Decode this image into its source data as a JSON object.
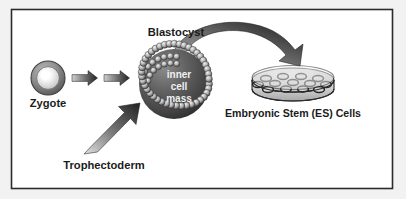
{
  "figure": {
    "background_color": "#f2f2f2",
    "panel_color": "#ffffff",
    "border_color": "#2b2b2b",
    "ink_color": "#1b1b1b"
  },
  "labels": {
    "zygote": "Zygote",
    "blastocyst": "Blastocyst",
    "trophectoderm": "Trophectoderm",
    "es_cells": "Embryonic Stem (ES) Cells"
  },
  "inner_cell_mass": {
    "line1": "inner",
    "line2": "cell",
    "line3": "mass"
  },
  "stages": [
    {
      "id": "zygote",
      "label": "Zygote",
      "shape": "sphere-with-zona-pellucida",
      "center": [
        48,
        78
      ],
      "radius": 17
    },
    {
      "id": "blastocyst",
      "label": "Blastocyst",
      "shape": "sphere-with-cell-ring",
      "center": [
        174,
        84
      ],
      "radius": 40,
      "inner_label": "inner cell mass",
      "trophectoderm_bead_count": 48
    },
    {
      "id": "es-cells-dish",
      "label": "Embryonic Stem (ES) Cells",
      "shape": "petri-dish",
      "center": [
        293,
        85
      ],
      "cell_count": 13
    }
  ],
  "arrows": [
    {
      "id": "zygote-to-blastocyst-1",
      "type": "straight",
      "direction": "right"
    },
    {
      "id": "zygote-to-blastocyst-2",
      "type": "straight",
      "direction": "right"
    },
    {
      "id": "trophectoderm-pointer",
      "type": "straight",
      "direction": "up-right"
    },
    {
      "id": "blastocyst-to-dish",
      "type": "curved",
      "direction": "arc-right-down"
    }
  ],
  "colors": {
    "sphere_dark": "#3a3a3a",
    "sphere_mid": "#6b6b6b",
    "bead_light": "#e8e8e8",
    "bead_dark": "#4a4a4a",
    "arrow_dark": "#333333",
    "arrow_light": "#d8d8d8",
    "dish_fill": "#dcdcdc",
    "dish_stroke": "#2b2b2b"
  }
}
